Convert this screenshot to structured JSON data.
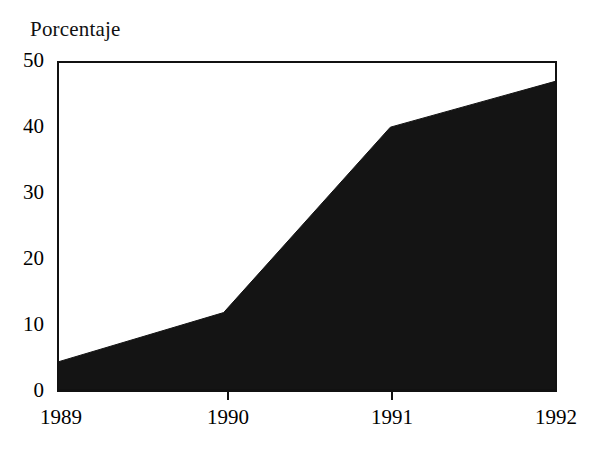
{
  "chart_data": {
    "type": "area",
    "title": "Porcentaje",
    "xlabel": "",
    "ylabel": "Porcentaje",
    "categories": [
      "1989",
      "1990",
      "1991",
      "1992"
    ],
    "x": [
      1989,
      1990,
      1991,
      1992
    ],
    "values": [
      4.5,
      12,
      40,
      47
    ],
    "series": [
      {
        "name": "Porcentaje",
        "values": [
          4.5,
          12,
          40,
          47
        ]
      }
    ],
    "ylim": [
      0,
      50
    ],
    "ytick_labels": [
      "0",
      "10",
      "20",
      "30",
      "40",
      "50"
    ],
    "ytick_values": [
      0,
      10,
      20,
      30,
      40,
      50
    ],
    "xtick_labels": [
      "1989",
      "1990",
      "1991",
      "1992"
    ],
    "grid": false,
    "legend": null,
    "legend_position": "none",
    "fill_color": "#141414",
    "line_color": "#000000",
    "axis_color": "#111111",
    "background_color": "#ffffff"
  }
}
